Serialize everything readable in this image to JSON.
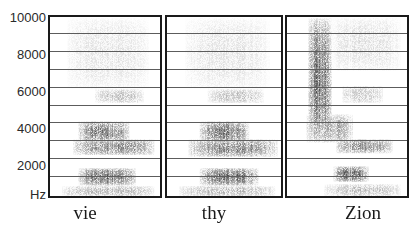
{
  "figure": {
    "type": "spectrogram-triptych",
    "y_axis": {
      "unit_label": "Hz",
      "tick_labels": [
        "10000",
        "8000",
        "6000",
        "4000",
        "2000"
      ],
      "ticks": [
        10000,
        8000,
        6000,
        4000,
        2000
      ],
      "gridlines_hz": [
        9000,
        8000,
        7000,
        6000,
        5000,
        4000,
        3000,
        2000,
        1000
      ],
      "range_hz": [
        0,
        10000
      ]
    },
    "panels": [
      {
        "word": "vie",
        "blobs": [
          {
            "x0": 0.25,
            "x1": 0.72,
            "f0": 3000,
            "f1": 4200,
            "d": 0.85
          },
          {
            "x0": 0.2,
            "x1": 0.95,
            "f0": 2300,
            "f1": 3200,
            "d": 0.75
          },
          {
            "x0": 0.25,
            "x1": 0.78,
            "f0": 600,
            "f1": 1600,
            "d": 0.9
          },
          {
            "x0": 0.1,
            "x1": 0.95,
            "f0": 0,
            "f1": 600,
            "d": 0.45
          },
          {
            "x0": 0.4,
            "x1": 0.85,
            "f0": 5200,
            "f1": 6000,
            "d": 0.4
          },
          {
            "x0": 0.15,
            "x1": 0.9,
            "f0": 6000,
            "f1": 10000,
            "d": 0.18
          }
        ]
      },
      {
        "word": "thy",
        "blobs": [
          {
            "x0": 0.28,
            "x1": 0.72,
            "f0": 3000,
            "f1": 4200,
            "d": 0.85
          },
          {
            "x0": 0.18,
            "x1": 0.97,
            "f0": 2200,
            "f1": 3200,
            "d": 0.75
          },
          {
            "x0": 0.28,
            "x1": 0.8,
            "f0": 600,
            "f1": 1600,
            "d": 0.9
          },
          {
            "x0": 0.1,
            "x1": 0.95,
            "f0": 0,
            "f1": 600,
            "d": 0.45
          },
          {
            "x0": 0.35,
            "x1": 0.85,
            "f0": 5200,
            "f1": 6000,
            "d": 0.4
          },
          {
            "x0": 0.15,
            "x1": 0.9,
            "f0": 6000,
            "f1": 10000,
            "d": 0.18
          }
        ]
      },
      {
        "word": "Zion",
        "blobs": [
          {
            "x0": 0.17,
            "x1": 0.37,
            "f0": 3000,
            "f1": 10000,
            "d": 0.9
          },
          {
            "x0": 0.15,
            "x1": 0.55,
            "f0": 3000,
            "f1": 4600,
            "d": 0.6
          },
          {
            "x0": 0.4,
            "x1": 0.88,
            "f0": 2400,
            "f1": 3200,
            "d": 0.7
          },
          {
            "x0": 0.38,
            "x1": 0.68,
            "f0": 800,
            "f1": 1700,
            "d": 0.9
          },
          {
            "x0": 0.3,
            "x1": 0.95,
            "f0": 0,
            "f1": 700,
            "d": 0.4
          },
          {
            "x0": 0.45,
            "x1": 0.8,
            "f0": 5200,
            "f1": 6200,
            "d": 0.35
          },
          {
            "x0": 0.35,
            "x1": 0.95,
            "f0": 7000,
            "f1": 10000,
            "d": 0.2
          }
        ]
      }
    ]
  }
}
